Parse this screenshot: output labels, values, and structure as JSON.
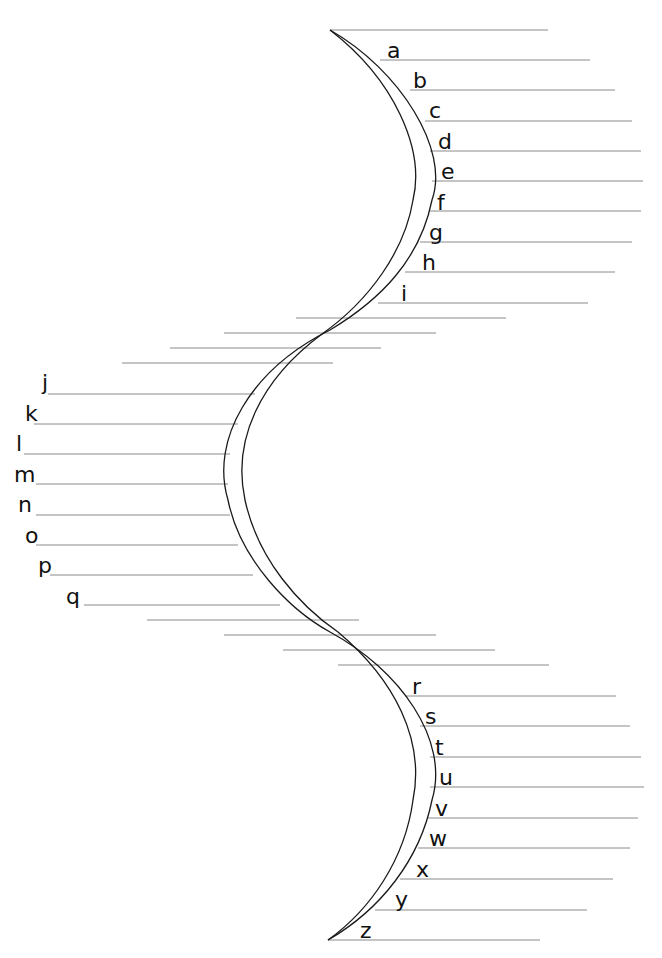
{
  "worksheet": {
    "title": "Alphabet S-curve handwriting worksheet",
    "colors": {
      "ink": "#1a1a1a",
      "rule": "#8a8a8a",
      "background": "#ffffff"
    },
    "letters": [
      {
        "char": "a",
        "x": 387,
        "y": 40
      },
      {
        "char": "b",
        "x": 413,
        "y": 70
      },
      {
        "char": "c",
        "x": 429,
        "y": 100
      },
      {
        "char": "d",
        "x": 438,
        "y": 131
      },
      {
        "char": "e",
        "x": 441,
        "y": 161
      },
      {
        "char": "f",
        "x": 437,
        "y": 192
      },
      {
        "char": "g",
        "x": 429,
        "y": 222
      },
      {
        "char": "h",
        "x": 422,
        "y": 252
      },
      {
        "char": "i",
        "x": 401,
        "y": 283
      },
      {
        "char": "j",
        "x": 42,
        "y": 372
      },
      {
        "char": "k",
        "x": 25,
        "y": 403
      },
      {
        "char": "l",
        "x": 16,
        "y": 433
      },
      {
        "char": "m",
        "x": 14,
        "y": 464
      },
      {
        "char": "n",
        "x": 18,
        "y": 494
      },
      {
        "char": "o",
        "x": 25,
        "y": 525
      },
      {
        "char": "p",
        "x": 38,
        "y": 555
      },
      {
        "char": "q",
        "x": 66,
        "y": 586
      },
      {
        "char": "r",
        "x": 412,
        "y": 676
      },
      {
        "char": "s",
        "x": 425,
        "y": 706
      },
      {
        "char": "t",
        "x": 435,
        "y": 737
      },
      {
        "char": "u",
        "x": 439,
        "y": 767
      },
      {
        "char": "v",
        "x": 435,
        "y": 798
      },
      {
        "char": "w",
        "x": 429,
        "y": 828
      },
      {
        "char": "x",
        "x": 416,
        "y": 859
      },
      {
        "char": "y",
        "x": 395,
        "y": 889
      },
      {
        "char": "z",
        "x": 360,
        "y": 920
      }
    ],
    "rules": [
      [
        330,
        30,
        548
      ],
      [
        380,
        60,
        590
      ],
      [
        410,
        90,
        615
      ],
      [
        425,
        121,
        632
      ],
      [
        430,
        151,
        641
      ],
      [
        432,
        181,
        643
      ],
      [
        430,
        211,
        641
      ],
      [
        420,
        242,
        632
      ],
      [
        405,
        272,
        615
      ],
      [
        378,
        303,
        588
      ],
      [
        296,
        318,
        506
      ],
      [
        224,
        333,
        436
      ],
      [
        170,
        348,
        381
      ],
      [
        122,
        363,
        333
      ],
      [
        48,
        394,
        255
      ],
      [
        34,
        424,
        238
      ],
      [
        24,
        454,
        230
      ],
      [
        36,
        484,
        228
      ],
      [
        36,
        515,
        230
      ],
      [
        36,
        545,
        238
      ],
      [
        50,
        575,
        253
      ],
      [
        84,
        605,
        280
      ],
      [
        147,
        620,
        359
      ],
      [
        224,
        635,
        436
      ],
      [
        283,
        650,
        495
      ],
      [
        338,
        665,
        549
      ],
      [
        405,
        696,
        616
      ],
      [
        420,
        726,
        630
      ],
      [
        430,
        757,
        641
      ],
      [
        430,
        787,
        644
      ],
      [
        428,
        818,
        638
      ],
      [
        418,
        848,
        630
      ],
      [
        400,
        879,
        613
      ],
      [
        375,
        910,
        587
      ],
      [
        328,
        940,
        540
      ]
    ]
  }
}
